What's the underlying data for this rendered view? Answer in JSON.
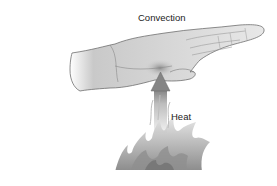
{
  "diagram": {
    "title_label": "Convection",
    "arrow_label": "Heat",
    "elements": {
      "hand": "hand-held-palm-down",
      "arrow": "upward-arrow",
      "fire": "flames"
    },
    "colors": {
      "background": "#ffffff",
      "hand_fill": "#d9d9d9",
      "hand_outline": "#6f6f6f",
      "arrow_fill": "#8a8a8a",
      "flame_fill": "#9a9a9a",
      "text": "#222222"
    }
  }
}
